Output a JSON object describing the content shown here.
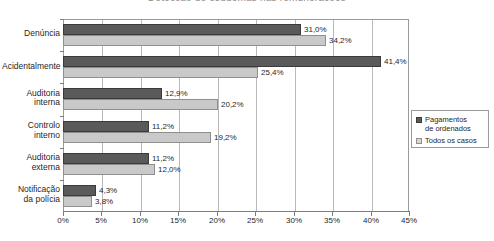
{
  "chart_data": {
    "type": "bar",
    "orientation": "horizontal",
    "title": "Detecção de esquemas nas remunerações",
    "xlabel": "",
    "ylabel": "",
    "xlim": [
      0,
      45
    ],
    "xticks": [
      "0%",
      "5%",
      "10%",
      "15%",
      "20%",
      "25%",
      "30%",
      "35%",
      "40%",
      "45%"
    ],
    "xtick_values": [
      0,
      5,
      10,
      15,
      20,
      25,
      30,
      35,
      40,
      45
    ],
    "grid": "vertical",
    "legend_position": "right",
    "categories": [
      "Denúncia",
      "Acidentalmente",
      "Auditoria interna",
      "Controlo interno",
      "Auditoria externa",
      "Notificação da polícia"
    ],
    "category_lines": [
      [
        "Denúncia"
      ],
      [
        "Acidentalmente"
      ],
      [
        "Auditoria",
        "interna"
      ],
      [
        "Controlo",
        "interno"
      ],
      [
        "Auditoria",
        "externa"
      ],
      [
        "Notificação",
        "da polícia"
      ]
    ],
    "series": [
      {
        "name": "Pagamentos de ordenados",
        "color": "#5a5a5a",
        "values": [
          31.0,
          41.4,
          12.9,
          11.2,
          11.2,
          4.3
        ],
        "labels": [
          "31,0%",
          "41,4%",
          "12,9%",
          "11,2%",
          "11,2%",
          "4,3%"
        ]
      },
      {
        "name": "Todos os casos",
        "color": "#c9c9c9",
        "values": [
          34.2,
          25.4,
          20.2,
          19.2,
          12.0,
          3.8
        ],
        "labels": [
          "34,2%",
          "25,4%",
          "20,2%",
          "19,2%",
          "12,0%",
          "3,8%"
        ]
      }
    ]
  },
  "legend": {
    "entries": [
      {
        "label_line1": "Pagamentos",
        "label_line2": "de ordenados",
        "swatch": "dark"
      },
      {
        "label_line1": "Todos os casos",
        "label_line2": "",
        "swatch": "light"
      }
    ]
  },
  "colors": {
    "series_dark": "#5a5a5a",
    "series_light": "#c9c9c9",
    "gridline": "#b9b9b9",
    "axis": "#7d7d7d",
    "text": "#1f1f1f",
    "background": "#ffffff"
  }
}
